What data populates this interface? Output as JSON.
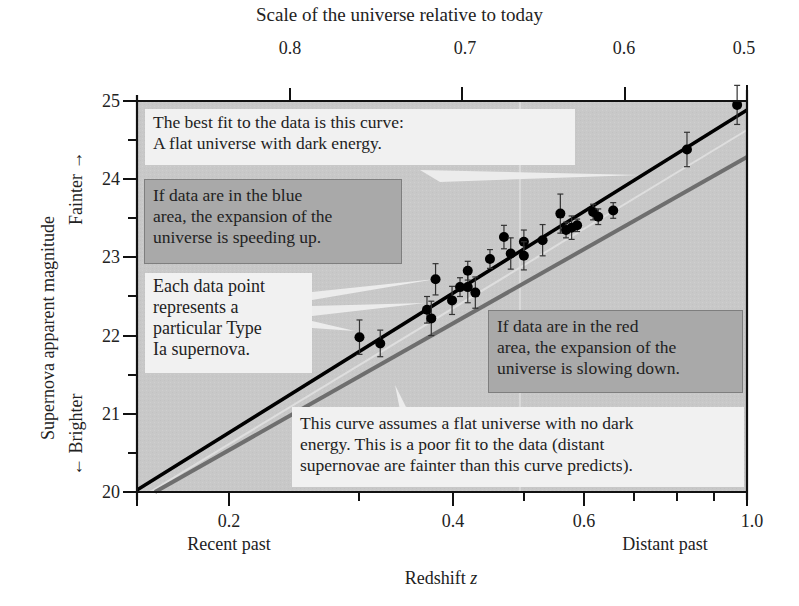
{
  "chart_data": {
    "type": "scatter",
    "title": "Scale of the universe relative to today",
    "xlabel": "Redshift z",
    "ylabel": "Supernova apparent magnitude",
    "x_scale": "log",
    "xlim": [
      0.15,
      1.0
    ],
    "ylim": [
      20,
      25
    ],
    "x_ticks": [
      0.2,
      0.4,
      0.6,
      1.0
    ],
    "x_tick_labels": [
      "0.2",
      "0.4",
      "0.6",
      "1.0"
    ],
    "x_sublabels": {
      "left": "Recent past",
      "right": "Distant past"
    },
    "y_ticks": [
      20,
      21,
      22,
      23,
      24,
      25
    ],
    "y_tick_labels": [
      "20",
      "21",
      "22",
      "23",
      "24",
      "25"
    ],
    "y_direction_labels": {
      "up": "Fainter",
      "down": "Brighter"
    },
    "top_axis": {
      "label": "Scale of the universe relative to today",
      "ticks": [
        "0.8",
        "0.7",
        "0.6",
        "0.5"
      ]
    },
    "grid": false,
    "series": [
      {
        "name": "Type Ia supernovae (data points with error bars)",
        "kind": "scatter",
        "points": [
          {
            "z": 0.3,
            "m": 21.98,
            "err": 0.22
          },
          {
            "z": 0.32,
            "m": 21.9,
            "err": 0.17
          },
          {
            "z": 0.37,
            "m": 22.33,
            "err": 0.17
          },
          {
            "z": 0.375,
            "m": 22.22,
            "err": 0.22
          },
          {
            "z": 0.38,
            "m": 22.72,
            "err": 0.2
          },
          {
            "z": 0.4,
            "m": 22.45,
            "err": 0.18
          },
          {
            "z": 0.41,
            "m": 22.62,
            "err": 0.12
          },
          {
            "z": 0.42,
            "m": 22.62,
            "err": 0.2
          },
          {
            "z": 0.42,
            "m": 22.83,
            "err": 0.12
          },
          {
            "z": 0.43,
            "m": 22.55,
            "err": 0.2
          },
          {
            "z": 0.45,
            "m": 22.98,
            "err": 0.12
          },
          {
            "z": 0.47,
            "m": 23.26,
            "err": 0.15
          },
          {
            "z": 0.48,
            "m": 23.05,
            "err": 0.2
          },
          {
            "z": 0.5,
            "m": 23.2,
            "err": 0.15
          },
          {
            "z": 0.5,
            "m": 23.02,
            "err": 0.18
          },
          {
            "z": 0.53,
            "m": 23.22,
            "err": 0.2
          },
          {
            "z": 0.56,
            "m": 23.56,
            "err": 0.25
          },
          {
            "z": 0.57,
            "m": 23.35,
            "err": 0.1
          },
          {
            "z": 0.58,
            "m": 23.38,
            "err": 0.15
          },
          {
            "z": 0.59,
            "m": 23.41,
            "err": 0.08
          },
          {
            "z": 0.62,
            "m": 23.58,
            "err": 0.1
          },
          {
            "z": 0.63,
            "m": 23.52,
            "err": 0.1
          },
          {
            "z": 0.66,
            "m": 23.6,
            "err": 0.1
          },
          {
            "z": 0.83,
            "m": 24.38,
            "err": 0.22
          },
          {
            "z": 0.97,
            "m": 24.95,
            "err": 0.25
          }
        ]
      },
      {
        "name": "Best fit: flat universe with dark energy",
        "kind": "line",
        "color": "#000000",
        "x": [
          0.15,
          1.0
        ],
        "y": [
          20.03,
          24.88
        ]
      },
      {
        "name": "Flat universe with no dark energy",
        "kind": "line",
        "color": "#6e6e6e",
        "x": [
          0.16,
          1.0
        ],
        "y": [
          20.0,
          24.27
        ]
      }
    ],
    "annotations": [
      "The best fit to the data is this curve: A flat universe with dark energy.",
      "If data are in the blue area, the expansion of the universe is speeding up.",
      "Each data point represents a particular Type Ia supernova.",
      "If data are in the red area, the expansion of the universe is slowing down.",
      "This curve assumes a flat universe with no dark energy. This is a poor fit to the data (distant supernovae are fainter than this curve predicts)."
    ]
  },
  "labels": {
    "top_title": "Scale of the universe relative to today",
    "top_ticks": [
      "0.8",
      "0.7",
      "0.6",
      "0.5"
    ],
    "y_title": "Supernova apparent magnitude",
    "y_fainter": "Fainter →",
    "y_brighter": "← Brighter",
    "y_ticks": [
      "25",
      "24",
      "23",
      "22",
      "21",
      "20"
    ],
    "x_ticks": [
      "0.2",
      "0.4",
      "0.6",
      "1.0"
    ],
    "x_recent": "Recent past",
    "x_distant": "Distant past",
    "x_title": "Redshift ",
    "x_title_var": "z"
  },
  "notes": {
    "best_fit_1": "The best fit to the data is this curve:",
    "best_fit_2": "A flat universe with dark energy.",
    "blue_1": "If data are in the blue",
    "blue_2": "area, the expansion of the",
    "blue_3": "universe is speeding up.",
    "point_1": "Each data point",
    "point_2": "represents a",
    "point_3": "particular Type",
    "point_4": "Ia supernova.",
    "red_1": "If data are in the red",
    "red_2": "area, the expansion of the",
    "red_3": "universe is slowing down.",
    "no_de_1": "This curve assumes a flat universe with no dark",
    "no_de_2": "energy. This is a poor fit to the data (distant",
    "no_de_3": "supernovae are fainter than this curve predicts)."
  },
  "colors": {
    "plot_bg": "#c9c9c9",
    "light_box": "#f1f1f1",
    "dark_box": "#a9a9a9",
    "best_fit_line": "#000000",
    "no_dark_energy_line": "#6e6e6e"
  }
}
